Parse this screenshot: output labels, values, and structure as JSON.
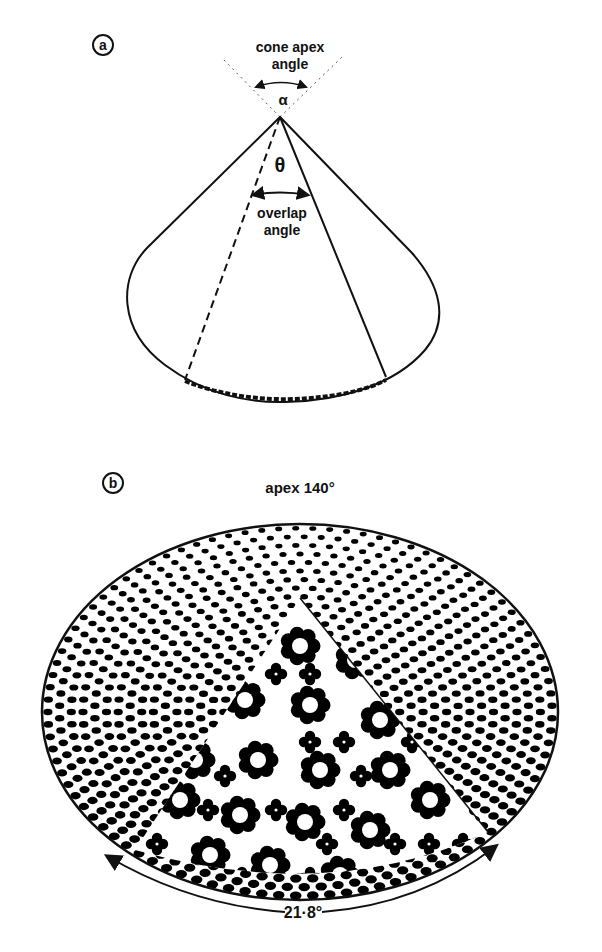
{
  "figure": {
    "panel_a": {
      "label": "a",
      "apex_text_line1": "cone apex",
      "apex_text_line2": "angle",
      "apex_symbol": "α",
      "overlap_symbol": "θ",
      "overlap_text_line1": "overlap",
      "overlap_text_line2": "angle"
    },
    "panel_b": {
      "label": "b",
      "title": "apex 140°",
      "arc_label": "21·8°",
      "pattern": {
        "outer_dot_color": "#000000",
        "ring_color": "#000000",
        "background": "#ffffff"
      }
    }
  }
}
